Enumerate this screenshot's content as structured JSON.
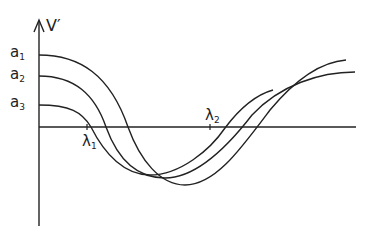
{
  "diagram": {
    "y_axis_label": "V′",
    "curve_labels": [
      {
        "main": "a",
        "sub": "1"
      },
      {
        "main": "a",
        "sub": "2"
      },
      {
        "main": "a",
        "sub": "3"
      }
    ],
    "lambda_labels": [
      {
        "main": "λ",
        "sub": "1"
      },
      {
        "main": "λ",
        "sub": "2"
      }
    ]
  },
  "colors": {
    "stroke": "#222222",
    "background": "#ffffff"
  }
}
